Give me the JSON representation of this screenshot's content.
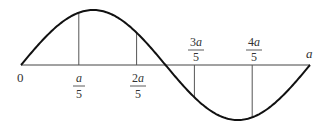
{
  "diagram": {
    "type": "sine-wave-with-subdivisions",
    "axis": {
      "start_label": "0",
      "end_label": "a"
    },
    "ticks": [
      {
        "numerator": "a",
        "denominator": "5",
        "position": 0.2,
        "side": "below"
      },
      {
        "numerator": "2a",
        "denominator": "5",
        "position": 0.4,
        "side": "below"
      },
      {
        "numerator": "3a",
        "denominator": "5",
        "position": 0.6,
        "side": "above"
      },
      {
        "numerator": "4a",
        "denominator": "5",
        "position": 0.8,
        "side": "above"
      }
    ],
    "colors": {
      "curve": "#111111",
      "axis": "#444444",
      "text": "#333333"
    }
  }
}
